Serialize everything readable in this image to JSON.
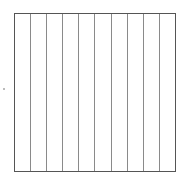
{
  "diagram": {
    "shape": "square",
    "strip_count": 10,
    "border_color": "#555555",
    "divider_color": "#8a8a8a",
    "background_color": "#ffffff"
  }
}
